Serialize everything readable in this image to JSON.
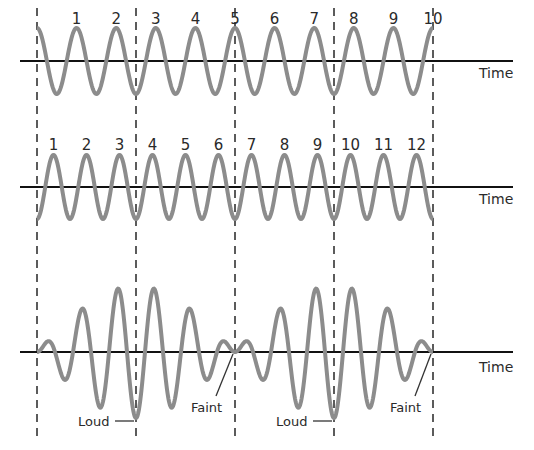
{
  "figure": {
    "colors": {
      "wave": "#8c8c8c",
      "axis": "#111111",
      "dash": "#333333",
      "text": "#2a2a2a"
    },
    "dashed_lines_x": [
      37,
      136,
      235,
      334,
      433
    ],
    "panels": [
      {
        "name": "wave-1",
        "baseline_y": 61,
        "amplitude": 33,
        "cycles": 10,
        "phase": "cos",
        "axis_label": "Time",
        "peak_labels": [
          "1",
          "2",
          "3",
          "4",
          "5",
          "6",
          "7",
          "8",
          "9",
          "10"
        ]
      },
      {
        "name": "wave-2",
        "baseline_y": 187,
        "amplitude": 32,
        "cycles": 12,
        "phase": "-cos",
        "axis_label": "Time",
        "peak_labels": [
          "1",
          "2",
          "3",
          "4",
          "5",
          "6",
          "7",
          "8",
          "9",
          "10",
          "11",
          "12"
        ]
      },
      {
        "name": "sum-wave",
        "baseline_y": 352,
        "amplitude": 33,
        "axis_label": "Time",
        "annotations": [
          {
            "text": "Loud",
            "x": 78,
            "y": 426,
            "target_x": 134,
            "target_y": 420
          },
          {
            "text": "Faint",
            "x": 191,
            "y": 412,
            "target_x": 233,
            "target_y": 354
          },
          {
            "text": "Loud",
            "x": 276,
            "y": 426,
            "target_x": 332,
            "target_y": 420
          },
          {
            "text": "Faint",
            "x": 390,
            "y": 412,
            "target_x": 431,
            "target_y": 354
          }
        ]
      }
    ]
  }
}
